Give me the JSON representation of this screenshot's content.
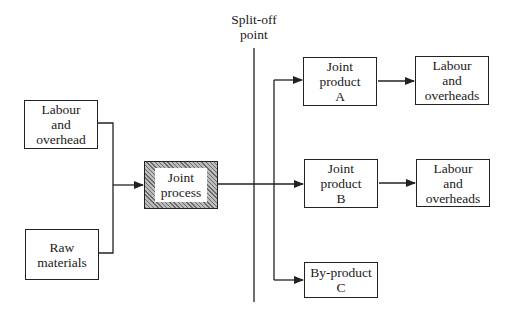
{
  "diagram": {
    "type": "flowchart",
    "split_off_label": "Split-off\npoint",
    "nodes": {
      "labour_in": "Labour\nand\noverhead",
      "raw_materials": "Raw\nmaterials",
      "joint_process": "Joint\nprocess",
      "product_a": "Joint\nproduct\nA",
      "product_b": "Joint\nproduct\nB",
      "byproduct_c": "By-product\nC",
      "labour_a": "Labour\nand\noverheads",
      "labour_b": "Labour\nand\noverheads"
    },
    "edges": [
      {
        "from": "labour_in",
        "to": "joint_process"
      },
      {
        "from": "raw_materials",
        "to": "joint_process"
      },
      {
        "from": "joint_process",
        "to": "product_a"
      },
      {
        "from": "joint_process",
        "to": "product_b"
      },
      {
        "from": "joint_process",
        "to": "byproduct_c"
      },
      {
        "from": "product_a",
        "to": "labour_a"
      },
      {
        "from": "product_b",
        "to": "labour_b"
      }
    ],
    "colors": {
      "line": "#222222",
      "hatch": "#6a6a6a",
      "background": "#ffffff"
    }
  }
}
